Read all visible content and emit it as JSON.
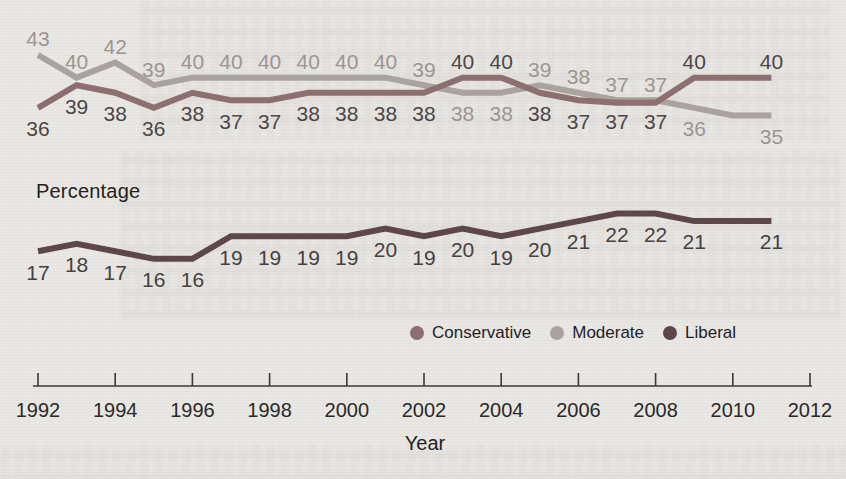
{
  "labels": {
    "percentage_axis_title": "Percentage",
    "year_axis_title": "Year"
  },
  "colors": {
    "background": "#e9e7e4",
    "axis": "#3b3836",
    "axis_text": "#2b2927"
  },
  "chart_data": {
    "type": "line",
    "title": "",
    "xlabel": "Year",
    "ylabel": "Percentage",
    "x_range": [
      1992,
      2012
    ],
    "x_tick_labels": [
      "1992",
      "1994",
      "1996",
      "1998",
      "2000",
      "2002",
      "2004",
      "2006",
      "2008",
      "2010",
      "2012"
    ],
    "x_ticks": [
      1992,
      1994,
      1996,
      1998,
      2000,
      2002,
      2004,
      2006,
      2008,
      2010,
      2012
    ],
    "years": [
      1992,
      1993,
      1994,
      1995,
      1996,
      1997,
      1998,
      1999,
      2000,
      2001,
      2002,
      2003,
      2004,
      2005,
      2006,
      2007,
      2008,
      2009,
      2010,
      2011
    ],
    "unlabeled_years": [
      2010
    ],
    "grid": false,
    "legend_position": "bottom-right",
    "series": [
      {
        "name": "Conservative",
        "color": "#8d6e71",
        "label_color": "#4d4648",
        "values": [
          36,
          39,
          38,
          36,
          38,
          37,
          37,
          38,
          38,
          38,
          38,
          40,
          40,
          38,
          37,
          37,
          37,
          40,
          40,
          40
        ]
      },
      {
        "name": "Moderate",
        "color": "#a9a29e",
        "label_color": "#9c9593",
        "values": [
          43,
          40,
          42,
          39,
          40,
          40,
          40,
          40,
          40,
          40,
          39,
          38,
          38,
          39,
          38,
          37,
          37,
          36,
          35,
          35
        ]
      },
      {
        "name": "Liberal",
        "color": "#5d474c",
        "label_color": "#454142",
        "values": [
          17,
          18,
          17,
          16,
          16,
          19,
          19,
          19,
          19,
          20,
          19,
          20,
          19,
          20,
          21,
          22,
          22,
          21,
          21,
          21
        ]
      }
    ]
  }
}
